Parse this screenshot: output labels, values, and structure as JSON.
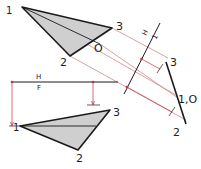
{
  "diagram": {
    "type": "descriptive-geometry-auxiliary-view",
    "colors": {
      "outline": "#1a1a1a",
      "fill": "#cfcfcf",
      "projector": "#c0343a",
      "thin": "#555555"
    },
    "top_view": {
      "labels": {
        "p1": "1",
        "p2": "2",
        "p3": "3",
        "pO": "O"
      }
    },
    "front_view": {
      "labels": {
        "p1": "1",
        "p2": "2",
        "p3": "3"
      }
    },
    "fold_line_hf": {
      "upper": "H",
      "lower": "F"
    },
    "fold_line_h1": {
      "upper": "H",
      "lower": "1"
    },
    "auxiliary_view": {
      "labels": {
        "p3": "3",
        "p10": "1,O",
        "p2": "2"
      }
    }
  }
}
